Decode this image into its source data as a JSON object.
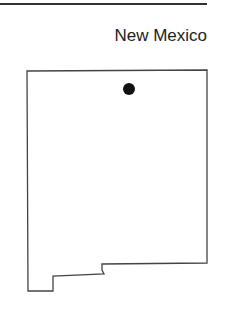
{
  "title": "New Mexico",
  "map": {
    "state": "New Mexico",
    "outline_color": "#444444",
    "marker": {
      "label": "location-marker",
      "color": "#111111"
    }
  }
}
